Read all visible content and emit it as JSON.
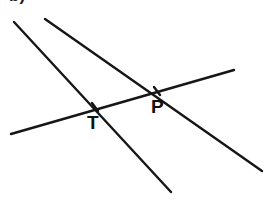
{
  "figure": {
    "type": "geometry-diagram",
    "width": 264,
    "height": 202,
    "background_color": "#ffffff",
    "line_color": "#161616",
    "label_color": "#111111",
    "corner_mark": "b)"
  },
  "lines": [
    {
      "id": "line-steep-left",
      "name": "steep-descending-line",
      "x1": 14,
      "y1": 22,
      "x2": 171,
      "y2": 192,
      "passes_through": [
        "T"
      ]
    },
    {
      "id": "line-shallow-right",
      "name": "second-descending-line",
      "x1": 45,
      "y1": 19,
      "x2": 262,
      "y2": 171,
      "passes_through": [
        "P"
      ]
    },
    {
      "id": "line-transversal",
      "name": "rising-transversal-line",
      "x1": 11,
      "y1": 134,
      "x2": 234,
      "y2": 70,
      "passes_through": [
        "T",
        "P"
      ]
    }
  ],
  "points": [
    {
      "id": "point-T",
      "label": "T",
      "x": 95,
      "y": 107,
      "label_x": 87,
      "label_y": 113,
      "marker": "tick"
    },
    {
      "id": "point-P",
      "label": "P",
      "x": 157,
      "y": 91,
      "label_x": 151,
      "label_y": 97,
      "marker": "tick"
    }
  ]
}
